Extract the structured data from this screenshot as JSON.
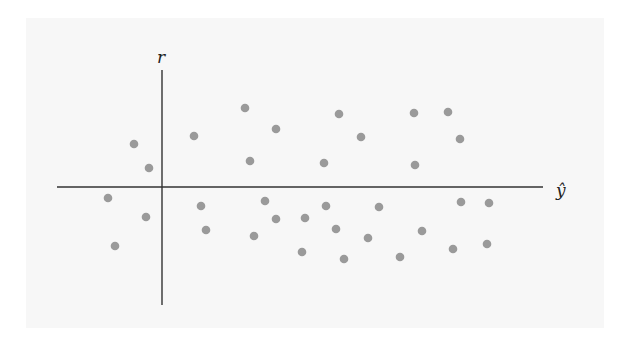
{
  "chart_data": {
    "type": "scatter",
    "title": "",
    "xlabel": "ŷ",
    "ylabel": "r",
    "grid": false,
    "legend": null,
    "axes": {
      "origin_px": [
        162,
        187
      ],
      "x_axis_px": {
        "x1": 57,
        "x2": 543,
        "y": 187
      },
      "y_axis_px": {
        "y1": 70,
        "y2": 305,
        "x": 162
      }
    },
    "point_color": "#9a9a9a",
    "axis_color": "#333333",
    "points_px": [
      [
        134,
        144
      ],
      [
        149,
        168
      ],
      [
        194,
        136
      ],
      [
        245,
        108
      ],
      [
        276,
        129
      ],
      [
        250,
        161
      ],
      [
        339,
        114
      ],
      [
        361,
        137
      ],
      [
        324,
        163
      ],
      [
        414,
        113
      ],
      [
        448,
        112
      ],
      [
        460,
        139
      ],
      [
        415,
        165
      ],
      [
        108,
        198
      ],
      [
        146,
        217
      ],
      [
        115,
        246
      ],
      [
        201,
        206
      ],
      [
        206,
        230
      ],
      [
        254,
        236
      ],
      [
        265,
        201
      ],
      [
        276,
        219
      ],
      [
        305,
        218
      ],
      [
        302,
        252
      ],
      [
        326,
        206
      ],
      [
        336,
        229
      ],
      [
        344,
        259
      ],
      [
        368,
        238
      ],
      [
        379,
        207
      ],
      [
        400,
        257
      ],
      [
        422,
        231
      ],
      [
        453,
        249
      ],
      [
        461,
        202
      ],
      [
        487,
        244
      ],
      [
        489,
        203
      ]
    ]
  },
  "labels": {
    "y_axis": "r",
    "x_axis": "ŷ"
  }
}
